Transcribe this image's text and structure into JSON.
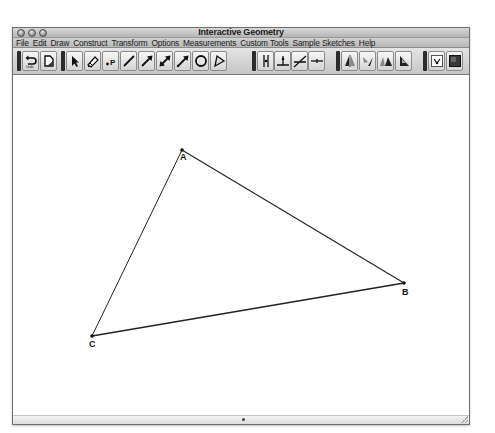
{
  "window": {
    "title": "Interactive Geometry",
    "buttons": [
      "close",
      "minimize",
      "zoom"
    ]
  },
  "menubar": {
    "items": [
      {
        "label": "File"
      },
      {
        "label": "Edit"
      },
      {
        "label": "Draw"
      },
      {
        "label": "Construct"
      },
      {
        "label": "Transform"
      },
      {
        "label": "Options"
      },
      {
        "label": "Measurements"
      },
      {
        "label": "Custom Tools"
      },
      {
        "label": "Sample Sketches"
      },
      {
        "label": "Help"
      }
    ]
  },
  "toolbar": {
    "groups": [
      {
        "name": "history",
        "tools": [
          {
            "id": "undo",
            "icon": "undo-icon",
            "sublabel": "Undo"
          },
          {
            "id": "redo",
            "icon": "document-icon"
          }
        ]
      },
      {
        "name": "draw",
        "tools": [
          {
            "id": "select",
            "icon": "arrow-pointer-icon"
          },
          {
            "id": "eraser",
            "icon": "pencil-eraser-icon"
          },
          {
            "id": "point",
            "icon": "point-icon",
            "sublabel": "P"
          },
          {
            "id": "segment",
            "icon": "segment-icon"
          },
          {
            "id": "ray",
            "icon": "ray-icon"
          },
          {
            "id": "line",
            "icon": "line-icon"
          },
          {
            "id": "vector",
            "icon": "vector-icon"
          },
          {
            "id": "circle",
            "icon": "circle-icon"
          },
          {
            "id": "polygon",
            "icon": "polygon-icon"
          }
        ]
      },
      {
        "name": "construct",
        "tools": [
          {
            "id": "parallel",
            "icon": "parallel-icon"
          },
          {
            "id": "perpendicular",
            "icon": "perpendicular-icon"
          },
          {
            "id": "bisector",
            "icon": "bisector-icon"
          },
          {
            "id": "midpoint",
            "icon": "midpoint-icon"
          }
        ]
      },
      {
        "name": "transform",
        "tools": [
          {
            "id": "reflect",
            "icon": "reflect-icon"
          },
          {
            "id": "rotate",
            "icon": "rotate-icon"
          },
          {
            "id": "translate",
            "icon": "translate-icon"
          },
          {
            "id": "dilate",
            "icon": "dilate-icon"
          }
        ]
      },
      {
        "name": "display",
        "tools": [
          {
            "id": "label",
            "icon": "label-icon"
          },
          {
            "id": "fill",
            "icon": "fill-icon"
          }
        ]
      }
    ]
  },
  "sketch": {
    "points": [
      {
        "label": "A",
        "x": 169,
        "y": 74
      },
      {
        "label": "B",
        "x": 391,
        "y": 207
      },
      {
        "label": "C",
        "x": 79,
        "y": 260
      }
    ],
    "segments": [
      [
        "A",
        "B"
      ],
      [
        "B",
        "C"
      ],
      [
        "C",
        "A"
      ]
    ],
    "stroke_color": "#222222"
  }
}
